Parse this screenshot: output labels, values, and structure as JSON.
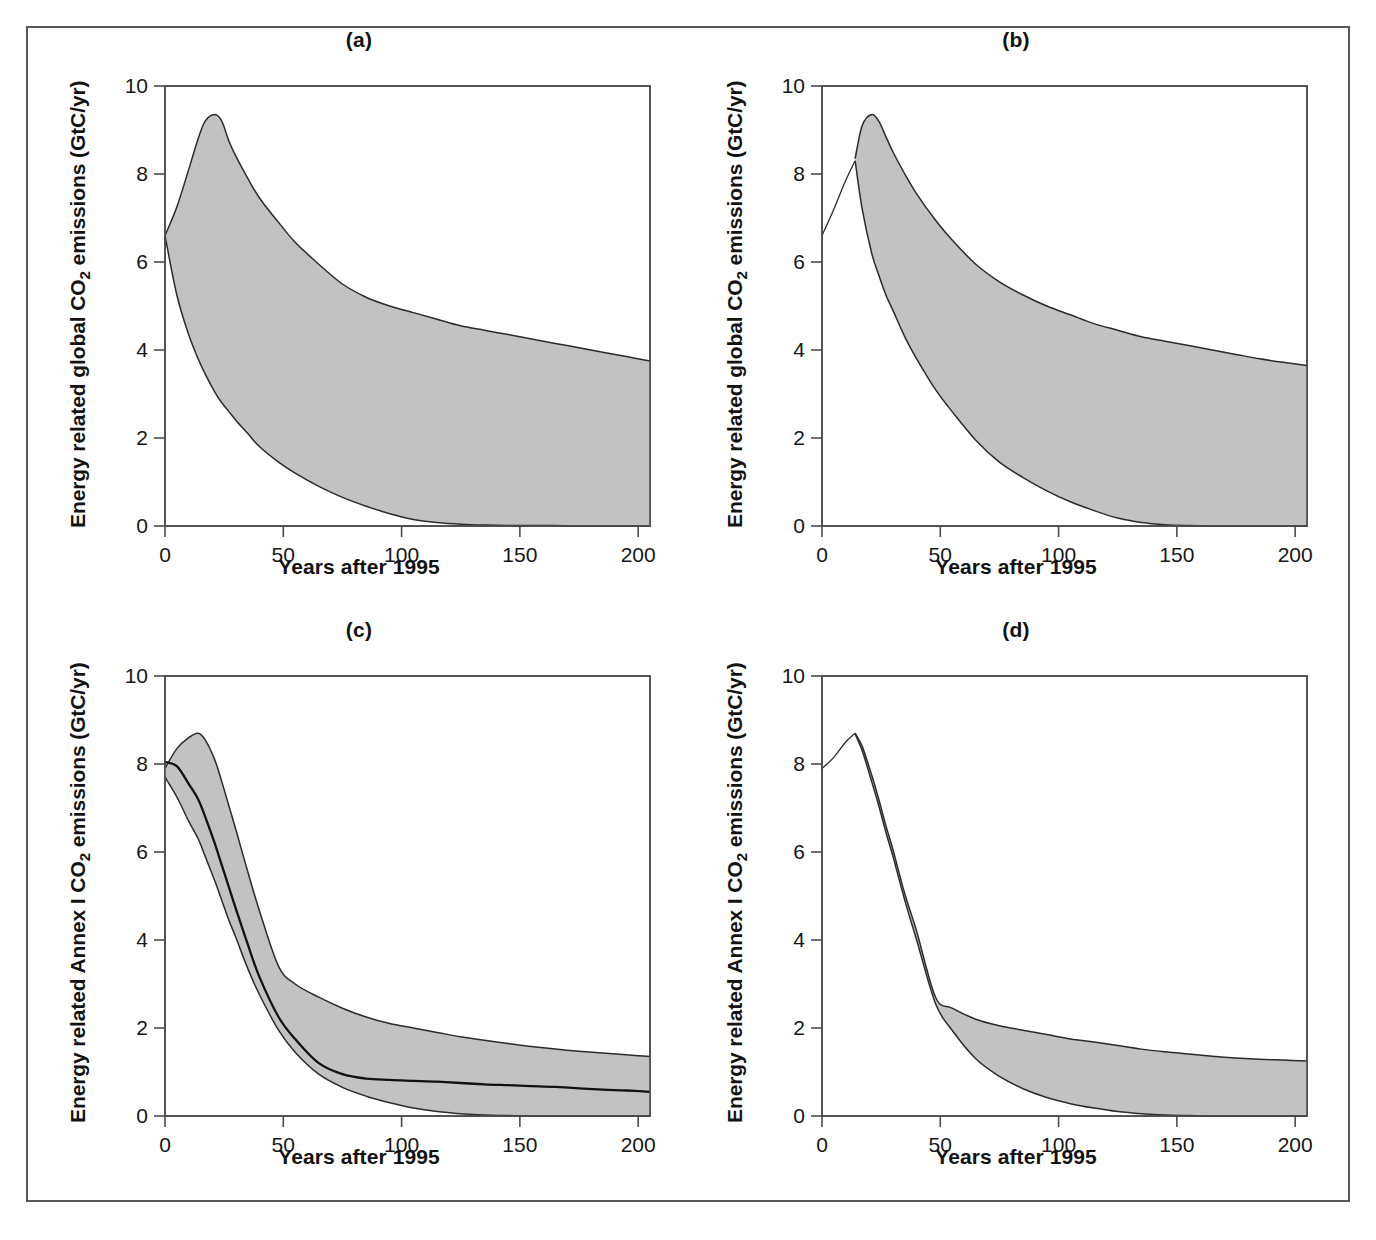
{
  "figure": {
    "panels": [
      {
        "id": "a",
        "label": "(a)",
        "ylabel_prefix": "Energy related global CO",
        "ylabel_sub": "2",
        "ylabel_suffix": " emissions (GtC/yr)",
        "xlabel": "Years after 1995"
      },
      {
        "id": "b",
        "label": "(b)",
        "ylabel_prefix": "Energy related global CO",
        "ylabel_sub": "2",
        "ylabel_suffix": " emissions (GtC/yr)",
        "xlabel": "Years after 1995"
      },
      {
        "id": "c",
        "label": "(c)",
        "ylabel_prefix": "Energy related Annex I CO",
        "ylabel_sub": "2",
        "ylabel_suffix": " emissions (GtC/yr)",
        "xlabel": "Years after 1995"
      },
      {
        "id": "d",
        "label": "(d)",
        "ylabel_prefix": "Energy related Annex I CO",
        "ylabel_sub": "2",
        "ylabel_suffix": " emissions (GtC/yr)",
        "xlabel": "Years after 1995"
      }
    ],
    "yticks": [
      "0",
      "2",
      "4",
      "6",
      "8",
      "10"
    ],
    "xticks": [
      "0",
      "50",
      "100",
      "150",
      "200"
    ],
    "colors": {
      "band_fill": "#c2c2c2",
      "band_edge": "#2b2b2b",
      "axis": "#4d4d4d",
      "median_line": "#111111",
      "frame": "#55595c"
    }
  },
  "chart_data": [
    {
      "type": "area",
      "panel": "a",
      "title": "(a)",
      "xlabel": "Years after 1995",
      "ylabel": "Energy related global CO2 emissions (GtC/yr)",
      "xlim": [
        0,
        205
      ],
      "ylim": [
        0,
        10
      ],
      "xticks": [
        0,
        50,
        100,
        150,
        200
      ],
      "yticks": [
        0,
        2,
        4,
        6,
        8,
        10
      ],
      "grid": false,
      "legend": "none",
      "x": [
        0,
        5,
        10,
        14,
        17,
        21,
        24,
        27,
        30,
        35,
        40,
        48,
        55,
        65,
        75,
        85,
        95,
        105,
        115,
        125,
        135,
        145,
        155,
        165,
        175,
        185,
        195,
        205
      ],
      "series": [
        {
          "name": "upper envelope",
          "values": [
            6.6,
            7.25,
            8.1,
            8.8,
            9.2,
            9.35,
            9.2,
            8.75,
            8.4,
            7.9,
            7.45,
            6.9,
            6.45,
            5.95,
            5.5,
            5.2,
            5.0,
            4.85,
            4.7,
            4.55,
            4.45,
            4.35,
            4.25,
            4.15,
            4.05,
            3.95,
            3.85,
            3.75
          ]
        },
        {
          "name": "lower envelope",
          "values": [
            6.6,
            5.25,
            4.35,
            3.8,
            3.45,
            3.05,
            2.8,
            2.6,
            2.4,
            2.1,
            1.8,
            1.45,
            1.2,
            0.9,
            0.65,
            0.45,
            0.28,
            0.15,
            0.08,
            0.04,
            0.02,
            0.01,
            0.01,
            0.01,
            0.0,
            0.0,
            0.0,
            0.0
          ]
        }
      ]
    },
    {
      "type": "area",
      "panel": "b",
      "title": "(b)",
      "xlabel": "Years after 1995",
      "ylabel": "Energy related global CO2 emissions (GtC/yr)",
      "xlim": [
        0,
        205
      ],
      "ylim": [
        0,
        10
      ],
      "xticks": [
        0,
        50,
        100,
        150,
        200
      ],
      "yticks": [
        0,
        2,
        4,
        6,
        8,
        10
      ],
      "grid": false,
      "legend": "none",
      "x": [
        0,
        5,
        10,
        14,
        17,
        21,
        24,
        27,
        30,
        35,
        40,
        48,
        55,
        65,
        75,
        85,
        95,
        105,
        115,
        125,
        135,
        145,
        155,
        165,
        175,
        185,
        195,
        205
      ],
      "series": [
        {
          "name": "pre-branch single line (0 to 14)",
          "values": [
            6.6,
            7.2,
            7.85,
            8.3,
            null,
            null,
            null,
            null,
            null,
            null,
            null,
            null,
            null,
            null,
            null,
            null,
            null,
            null,
            null,
            null,
            null,
            null,
            null,
            null,
            null,
            null,
            null,
            null
          ]
        },
        {
          "name": "upper envelope",
          "values": [
            null,
            null,
            null,
            8.35,
            9.1,
            9.35,
            9.2,
            8.85,
            8.5,
            8.0,
            7.55,
            6.95,
            6.5,
            5.95,
            5.55,
            5.25,
            5.0,
            4.8,
            4.6,
            4.45,
            4.3,
            4.2,
            4.1,
            4.0,
            3.9,
            3.8,
            3.72,
            3.65
          ]
        },
        {
          "name": "lower envelope",
          "values": [
            null,
            null,
            null,
            8.3,
            7.2,
            6.2,
            5.7,
            5.25,
            4.9,
            4.3,
            3.8,
            3.1,
            2.6,
            1.95,
            1.45,
            1.1,
            0.8,
            0.55,
            0.35,
            0.18,
            0.08,
            0.03,
            0.01,
            0.0,
            0.0,
            0.0,
            0.0,
            0.0
          ]
        }
      ]
    },
    {
      "type": "area",
      "panel": "c",
      "title": "(c)",
      "xlabel": "Years after 1995",
      "ylabel": "Energy related Annex I CO2 emissions (GtC/yr)",
      "xlim": [
        0,
        205
      ],
      "ylim": [
        0,
        10
      ],
      "xticks": [
        0,
        50,
        100,
        150,
        200
      ],
      "yticks": [
        0,
        2,
        4,
        6,
        8,
        10
      ],
      "grid": false,
      "legend": "none",
      "x": [
        0,
        5,
        10,
        14,
        17,
        21,
        24,
        27,
        30,
        35,
        40,
        48,
        55,
        65,
        75,
        85,
        95,
        105,
        115,
        125,
        135,
        145,
        155,
        165,
        175,
        185,
        195,
        205
      ],
      "series": [
        {
          "name": "upper envelope",
          "values": [
            7.9,
            8.35,
            8.6,
            8.7,
            8.55,
            8.1,
            7.6,
            7.05,
            6.5,
            5.55,
            4.65,
            3.4,
            3.0,
            2.7,
            2.45,
            2.25,
            2.1,
            2.0,
            1.9,
            1.8,
            1.72,
            1.65,
            1.58,
            1.52,
            1.47,
            1.43,
            1.39,
            1.35
          ]
        },
        {
          "name": "median",
          "values": [
            8.05,
            7.95,
            7.55,
            7.2,
            6.8,
            6.2,
            5.7,
            5.2,
            4.7,
            3.9,
            3.15,
            2.25,
            1.75,
            1.2,
            0.95,
            0.85,
            0.82,
            0.8,
            0.78,
            0.75,
            0.72,
            0.7,
            0.68,
            0.66,
            0.63,
            0.6,
            0.58,
            0.55
          ]
        },
        {
          "name": "lower envelope",
          "values": [
            7.7,
            7.25,
            6.7,
            6.3,
            5.9,
            5.35,
            4.9,
            4.45,
            4.05,
            3.35,
            2.75,
            1.95,
            1.45,
            0.95,
            0.65,
            0.45,
            0.3,
            0.18,
            0.1,
            0.05,
            0.02,
            0.01,
            0.0,
            0.0,
            0.0,
            0.0,
            0.0,
            0.0
          ]
        }
      ]
    },
    {
      "type": "area",
      "panel": "d",
      "title": "(d)",
      "xlabel": "Years after 1995",
      "ylabel": "Energy related Annex I CO2 emissions (GtC/yr)",
      "xlim": [
        0,
        205
      ],
      "ylim": [
        0,
        10
      ],
      "xticks": [
        0,
        50,
        100,
        150,
        200
      ],
      "yticks": [
        0,
        2,
        4,
        6,
        8,
        10
      ],
      "grid": false,
      "legend": "none",
      "x": [
        0,
        5,
        10,
        14,
        17,
        21,
        24,
        27,
        30,
        35,
        40,
        48,
        55,
        65,
        75,
        85,
        95,
        105,
        115,
        125,
        135,
        145,
        155,
        165,
        175,
        185,
        195,
        205
      ],
      "series": [
        {
          "name": "pre-branch single line (0 to 14)",
          "values": [
            7.9,
            8.15,
            8.5,
            8.7,
            null,
            null,
            null,
            null,
            null,
            null,
            null,
            null,
            null,
            null,
            null,
            null,
            null,
            null,
            null,
            null,
            null,
            null,
            null,
            null,
            null,
            null,
            null,
            null
          ]
        },
        {
          "name": "upper envelope",
          "values": [
            null,
            null,
            null,
            8.7,
            8.4,
            7.75,
            7.2,
            6.6,
            6.05,
            5.05,
            4.2,
            2.7,
            2.45,
            2.2,
            2.05,
            1.95,
            1.85,
            1.75,
            1.68,
            1.6,
            1.52,
            1.46,
            1.41,
            1.36,
            1.32,
            1.29,
            1.27,
            1.25
          ]
        },
        {
          "name": "lower envelope",
          "values": [
            null,
            null,
            null,
            8.68,
            8.3,
            7.6,
            7.05,
            6.45,
            5.9,
            4.9,
            4.0,
            2.55,
            1.95,
            1.3,
            0.9,
            0.62,
            0.42,
            0.28,
            0.18,
            0.1,
            0.05,
            0.02,
            0.01,
            0.0,
            0.0,
            0.0,
            0.0,
            0.0
          ]
        }
      ]
    }
  ],
  "caption": {
    "text": ""
  }
}
